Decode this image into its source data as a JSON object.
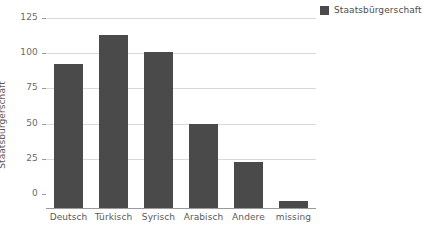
{
  "chart_data": {
    "type": "bar",
    "title": "",
    "xlabel": "",
    "ylabel": "Staatsbürgerschaft",
    "categories": [
      "Deutsch",
      "Türkisch",
      "Syrisch",
      "Arabisch",
      "Andere",
      "missing"
    ],
    "values": [
      102,
      123,
      111,
      60,
      33,
      5
    ],
    "series": [
      {
        "name": "Staatsbürgerschaft",
        "values": [
          102,
          123,
          111,
          60,
          33,
          5
        ],
        "color": "#4a4a4a"
      }
    ],
    "ylim": [
      0,
      125
    ],
    "yticks": [
      0,
      25,
      50,
      75,
      100,
      125
    ],
    "ytick_labels": [
      "0",
      "25",
      "50",
      "75",
      "100",
      "125"
    ],
    "grid": true,
    "grid_axis": "y",
    "grid_color": "#d9d9d9",
    "legend": {
      "position": "right",
      "entries": [
        {
          "label": "Staatsbürgerschaft",
          "color": "#4a4a4a"
        }
      ]
    },
    "background_color": "#ffffff",
    "axis_color": "#9a9a9a",
    "tick_label_color": "#6b6b6b"
  }
}
